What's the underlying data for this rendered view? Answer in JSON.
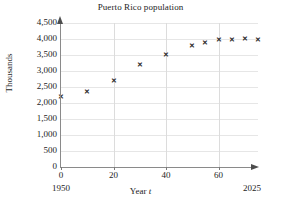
{
  "chart_data": {
    "type": "scatter",
    "title": "Puerto Rico population",
    "xlabel": "Year t",
    "ylabel": "Thousands",
    "xlim": [
      0,
      75
    ],
    "ylim": [
      0,
      4500
    ],
    "grid": true,
    "legend": null,
    "x_tick_labels": [
      "0",
      "20",
      "40",
      "60"
    ],
    "x_ticks": [
      0,
      20,
      40,
      60
    ],
    "y_tick_labels": [
      "0",
      "500",
      "1,000",
      "1,500",
      "2,000",
      "2,500",
      "3,000",
      "3,500",
      "4,000",
      "4,500"
    ],
    "y_ticks": [
      0,
      500,
      1000,
      1500,
      2000,
      2500,
      3000,
      3500,
      4000,
      4500
    ],
    "x_axis_start_year": "1950",
    "x_axis_end_year": "2025",
    "marker": "x",
    "marker_glyph": "✕",
    "marker_color": "#2a2a2a",
    "x": [
      0,
      10,
      20,
      30,
      40,
      50,
      55,
      60,
      65,
      70,
      75
    ],
    "values": [
      2210,
      2360,
      2690,
      3195,
      3520,
      3810,
      3880,
      3970,
      4000,
      4010,
      3990
    ],
    "points": [
      {
        "t": 0,
        "year": 1950,
        "population": 2210
      },
      {
        "t": 10,
        "year": 1960,
        "population": 2360
      },
      {
        "t": 20,
        "year": 1970,
        "population": 2690
      },
      {
        "t": 30,
        "year": 1980,
        "population": 3195
      },
      {
        "t": 40,
        "year": 1990,
        "population": 3520
      },
      {
        "t": 50,
        "year": 2000,
        "population": 3810
      },
      {
        "t": 55,
        "year": 2005,
        "population": 3880
      },
      {
        "t": 60,
        "year": 2010,
        "population": 3970
      },
      {
        "t": 65,
        "year": 2015,
        "population": 4000
      },
      {
        "t": 70,
        "year": 2020,
        "population": 4010
      },
      {
        "t": 75,
        "year": 2025,
        "population": 3990
      }
    ]
  },
  "colors": {
    "background": "#ffffff",
    "axis": "#8a8a8a",
    "gridline_horizontal": "#e6e6e6",
    "gridline_vertical": "#dcdcdc",
    "text": "#1d1d1d",
    "marker": "#2a2a2a"
  }
}
